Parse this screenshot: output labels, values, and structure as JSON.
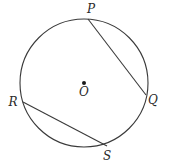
{
  "diagram": {
    "type": "circle-with-chords",
    "circle": {
      "cx": 84,
      "cy": 83,
      "r": 64,
      "stroke": "#3a3a3a"
    },
    "center": {
      "label": "O",
      "x": 84,
      "y": 83,
      "label_x": 84,
      "label_y": 96
    },
    "points": [
      {
        "label": "P",
        "x": 88,
        "y": 19,
        "label_x": 91,
        "label_y": 13
      },
      {
        "label": "Q",
        "x": 146,
        "y": 95,
        "label_x": 153,
        "label_y": 104
      },
      {
        "label": "R",
        "x": 23,
        "y": 102,
        "label_x": 13,
        "label_y": 106
      },
      {
        "label": "S",
        "x": 107,
        "y": 146,
        "label_x": 107,
        "label_y": 160
      }
    ],
    "chords": [
      {
        "name": "PQ",
        "from": "P",
        "to": "Q"
      },
      {
        "name": "RS",
        "from": "R",
        "to": "S"
      }
    ]
  }
}
